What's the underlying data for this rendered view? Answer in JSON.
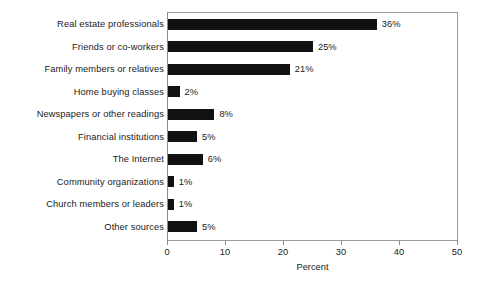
{
  "chart_data": {
    "type": "bar",
    "orientation": "horizontal",
    "title": "",
    "xlabel": "Percent",
    "ylabel": "",
    "xlim": [
      0,
      50
    ],
    "xticks": [
      0,
      10,
      20,
      30,
      40,
      50
    ],
    "xtick_labels": [
      "0",
      "10",
      "20",
      "30",
      "40",
      "50"
    ],
    "grid": false,
    "legend": false,
    "bar_color": "#111111",
    "frame_color": "#9a9a9a",
    "categories": [
      "Real estate professionals",
      "Friends or co-workers",
      "Family members or relatives",
      "Home buying classes",
      "Newspapers or other readings",
      "Financial institutions",
      "The Internet",
      "Community organizations",
      "Church members or leaders",
      "Other sources"
    ],
    "values": [
      36,
      25,
      21,
      2,
      8,
      5,
      6,
      1,
      1,
      5
    ],
    "value_labels": [
      "36%",
      "25%",
      "21%",
      "2%",
      "8%",
      "5%",
      "6%",
      "1%",
      "1%",
      "5%"
    ]
  }
}
